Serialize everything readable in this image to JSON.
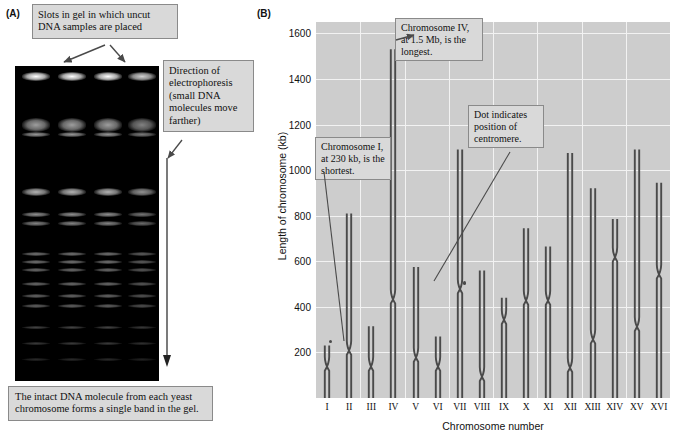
{
  "panels": {
    "a": {
      "letter": "(A)",
      "callouts": {
        "slots": "Slots in gel in which uncut DNA samples are placed",
        "direction": "Direction of electrophoresis (small DNA molecules move farther)",
        "intact": "The intact DNA molecule from each yeast chromosome forms a single band in the gel."
      },
      "gel": {
        "lanes": 4,
        "description": "pulsed-field gel electrophoresis of yeast chromosomes"
      }
    },
    "b": {
      "letter": "(B)",
      "callouts": {
        "longest": "Chromosome IV, at 1.5 Mb, is the longest.",
        "shortest": "Chromosome I, at 230 kb, is the shortest.",
        "centromere": "Dot indicates position of centromere."
      }
    }
  },
  "chart_data": {
    "type": "bar",
    "title": "",
    "xlabel": "Chromosome number",
    "ylabel": "Length of chromosome (kb)",
    "ylim": [
      0,
      1650
    ],
    "yticks": [
      200,
      400,
      600,
      800,
      1000,
      1200,
      1400,
      1600
    ],
    "grid": true,
    "legend": "none",
    "categories": [
      "I",
      "II",
      "III",
      "IV",
      "V",
      "VI",
      "VII",
      "VIII",
      "IX",
      "X",
      "XI",
      "XII",
      "XIII",
      "XIV",
      "XV",
      "XVI"
    ],
    "values": [
      230,
      810,
      315,
      1530,
      575,
      270,
      1090,
      560,
      440,
      745,
      665,
      1075,
      920,
      785,
      1090,
      945
    ],
    "centromere_positions": [
      150,
      220,
      150,
      445,
      190,
      150,
      490,
      105,
      355,
      440,
      440,
      145,
      270,
      630,
      325,
      555
    ],
    "series": [
      {
        "name": "Chromosome length (kb)",
        "values": [
          230,
          810,
          315,
          1530,
          575,
          270,
          1090,
          560,
          440,
          745,
          665,
          1075,
          920,
          785,
          1090,
          945
        ]
      }
    ]
  },
  "colors": {
    "plot_background": "#cdcdcd",
    "gridline": "#f2f2f2",
    "chromosome": "#4a4a4a",
    "callout_fill": "#d9d9d9",
    "callout_border": "#8a8a8a",
    "gel_background": "#000000"
  }
}
